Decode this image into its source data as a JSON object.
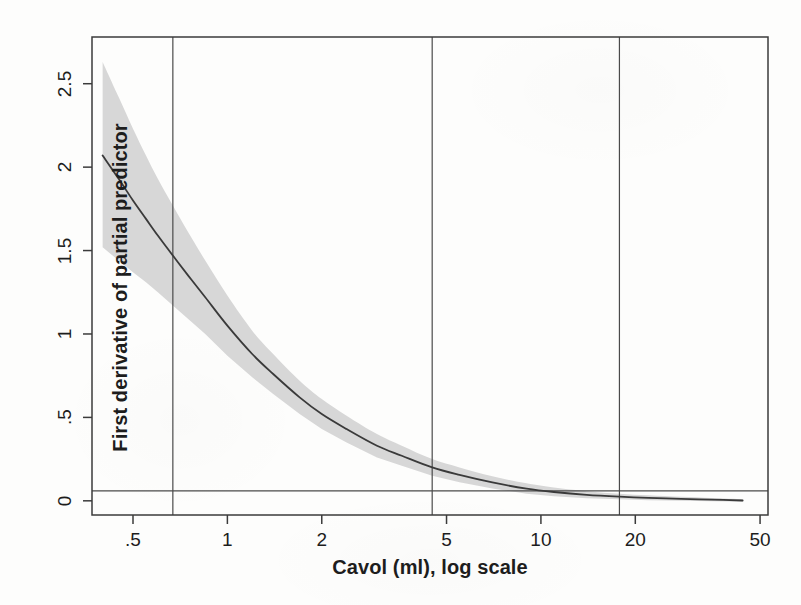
{
  "figure": {
    "background_color": "#fdfdfc",
    "plot_box": {
      "left": 92,
      "top": 37,
      "right": 768,
      "bottom": 515
    }
  },
  "chart_data": {
    "type": "line",
    "title": "",
    "subtitle": "",
    "xlabel": "Cavol (ml), log scale",
    "ylabel": "First derivative of partial predictor",
    "x_scale": "log",
    "y_scale": "linear",
    "xlim": [
      0.37,
      53
    ],
    "ylim": [
      -0.085,
      2.78
    ],
    "x_tick_values": [
      0.5,
      1,
      2,
      5,
      10,
      20,
      50
    ],
    "x_tick_labels": [
      ".5",
      "1",
      "2",
      "5",
      "10",
      "20",
      "50"
    ],
    "y_tick_values": [
      0,
      0.5,
      1,
      1.5,
      2,
      2.5
    ],
    "y_tick_labels": [
      "0",
      ".5",
      "1",
      "1.5",
      "2",
      "2.5"
    ],
    "grid": false,
    "legend": "none",
    "line_color": "#3a3a3a",
    "band_color": "#d7d7d7",
    "reference_line_color": "#4a4a4a",
    "series": [
      {
        "name": "First derivative of partial predictor",
        "style": "solid",
        "x": [
          0.4,
          0.45,
          0.5,
          0.55,
          0.6,
          0.67,
          0.75,
          0.85,
          1.0,
          1.2,
          1.4,
          1.7,
          2.0,
          2.4,
          3.0,
          3.6,
          4.5,
          5.5,
          7.0,
          9.0,
          11.0,
          14.0,
          17.8,
          22.0,
          28.0,
          35.0,
          44.0
        ],
        "y": [
          2.07,
          1.93,
          1.8,
          1.69,
          1.59,
          1.47,
          1.35,
          1.22,
          1.05,
          0.88,
          0.76,
          0.62,
          0.52,
          0.43,
          0.33,
          0.27,
          0.2,
          0.155,
          0.11,
          0.073,
          0.053,
          0.036,
          0.025,
          0.018,
          0.012,
          0.007,
          0.002
        ]
      }
    ],
    "confidence_band": {
      "label": "pointwise confidence band",
      "x": [
        0.4,
        0.45,
        0.5,
        0.55,
        0.6,
        0.67,
        0.75,
        0.85,
        1.0,
        1.2,
        1.4,
        1.7,
        2.0,
        2.4,
        3.0,
        3.6,
        4.5,
        5.5,
        7.0,
        9.0,
        11.0,
        14.0,
        17.8,
        22.0,
        28.0,
        35.0,
        44.0
      ],
      "upper": [
        2.63,
        2.42,
        2.23,
        2.07,
        1.93,
        1.77,
        1.61,
        1.44,
        1.23,
        1.02,
        0.88,
        0.72,
        0.61,
        0.51,
        0.4,
        0.33,
        0.25,
        0.2,
        0.147,
        0.105,
        0.08,
        0.058,
        0.043,
        0.033,
        0.024,
        0.017,
        0.01
      ],
      "lower": [
        1.52,
        1.44,
        1.37,
        1.31,
        1.25,
        1.17,
        1.09,
        1.0,
        0.87,
        0.74,
        0.64,
        0.52,
        0.43,
        0.35,
        0.26,
        0.21,
        0.15,
        0.112,
        0.074,
        0.043,
        0.028,
        0.016,
        0.009,
        0.004,
        0.001,
        -0.003,
        -0.006
      ]
    },
    "reference_lines": {
      "horizontal": [
        {
          "y": 0.06,
          "label": ""
        }
      ],
      "vertical": [
        {
          "x": 0.67,
          "label": ""
        },
        {
          "x": 4.5,
          "label": ""
        },
        {
          "x": 17.8,
          "label": ""
        }
      ]
    },
    "annotations": []
  }
}
